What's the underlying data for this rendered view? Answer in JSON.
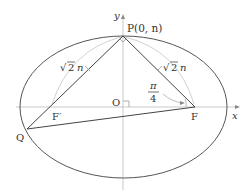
{
  "diagram": {
    "type": "ellipse with focal triangle",
    "axes": {
      "x_label": "x",
      "y_label": "y"
    },
    "origin_label": "O",
    "points": {
      "P": {
        "label": "P(0, n)"
      },
      "F": {
        "label": "F"
      },
      "F_prime": {
        "label": "F′"
      },
      "Q": {
        "label": "Q"
      }
    },
    "segment_labels": {
      "PF_prime": {
        "radical": "√",
        "value": "2",
        "var": "n"
      },
      "PF": {
        "radical": "√",
        "value": "2",
        "var": "n"
      }
    },
    "angle_label": {
      "numerator": "π",
      "denominator": "4"
    },
    "colors": {
      "ellipse": "#555555",
      "axes": "#bbbbbb",
      "segments": "#444444",
      "arcs": "#cccccc"
    }
  }
}
